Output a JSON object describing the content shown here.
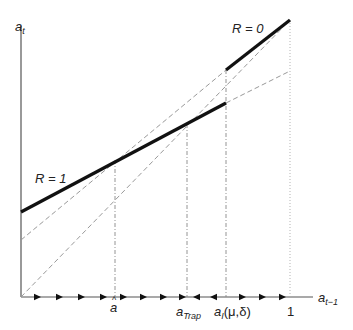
{
  "figure": {
    "y_axis_label": {
      "base": "a",
      "sub": "t"
    },
    "x_axis_label": {
      "base": "a",
      "sub": "t−1"
    },
    "regimes": [
      {
        "label": "R = 0",
        "line": "upper thick segment, right of a_I(μ,δ)"
      },
      {
        "label": "R = 1",
        "line": "lower thick segment, left of a_I(μ,δ)"
      }
    ],
    "x_ticks": [
      {
        "id": "a_hat",
        "base": "a",
        "accent": "^"
      },
      {
        "id": "a_trap",
        "base": "a",
        "sub": "Trap"
      },
      {
        "id": "a_I",
        "base": "a",
        "sub": "I",
        "args": "(μ,δ)"
      },
      {
        "id": "one",
        "text": "1"
      }
    ],
    "axis_arrows": [
      {
        "x": 37,
        "dir": "right"
      },
      {
        "x": 59,
        "dir": "right"
      },
      {
        "x": 81,
        "dir": "right"
      },
      {
        "x": 103,
        "dir": "right"
      },
      {
        "x": 123,
        "dir": "right"
      },
      {
        "x": 143,
        "dir": "right"
      },
      {
        "x": 163,
        "dir": "right"
      },
      {
        "x": 182,
        "dir": "right"
      },
      {
        "x": 197,
        "dir": "left"
      },
      {
        "x": 214,
        "dir": "left"
      },
      {
        "x": 242,
        "dir": "right"
      },
      {
        "x": 262,
        "dir": "right"
      },
      {
        "x": 282,
        "dir": "right"
      }
    ],
    "colors": {
      "ink": "#111111",
      "dash": "#888888",
      "axis": "#555555"
    }
  }
}
